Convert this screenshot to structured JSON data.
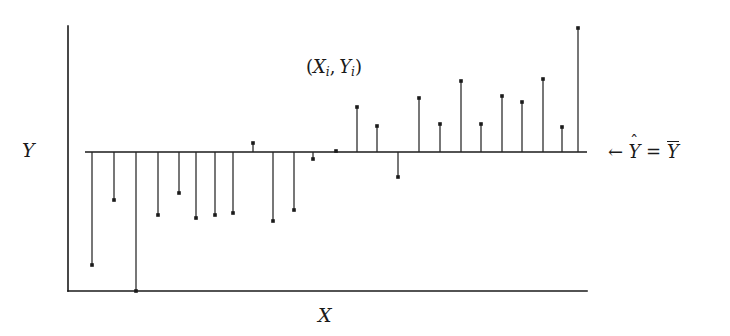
{
  "figure": {
    "title_alt": "Residual stem plot about the mean",
    "background_color": "#ffffff",
    "ink_color": "#1a1a1a"
  },
  "labels": {
    "y_axis": "Y",
    "x_axis": "X",
    "point_label_open": "(",
    "point_label_x": "X",
    "point_label_x_sub": "i",
    "point_label_comma": ",",
    "point_label_y": "Y",
    "point_label_y_sub": "i",
    "point_label_close": ")",
    "fit_arrow": "←",
    "fit_yhat": "Y",
    "fit_hat": "ˆ",
    "fit_equals": "=",
    "fit_ybar": "Y"
  },
  "chart_data": {
    "type": "scatter",
    "title": "",
    "xlabel": "X",
    "ylabel": "Y",
    "grid": false,
    "legend": null,
    "annotations": [
      {
        "text": "(X_i, Y_i)",
        "x_px": 306,
        "y_px": 58
      },
      {
        "text": "← Ŷ = Ȳ",
        "x_px": 608,
        "y_px": 141
      }
    ],
    "baseline": {
      "label": "Yhat = Ybar",
      "value": 0,
      "y_px": 152,
      "x_start_px": 85,
      "x_end_px": 587
    },
    "axes": {
      "y_axis_x_px": 68,
      "y_axis_top_px": 26,
      "y_axis_bottom_px": 291,
      "x_axis_y_px": 291,
      "x_axis_start_px": 68,
      "x_axis_end_px": 587
    },
    "note": "Residuals (Y_i - Ybar) plotted as vertical stems from the mean line; px values are screen coordinates, residual is (152 - y_px) so positive means above the mean line.",
    "points": [
      {
        "x_px": 92,
        "tip_y_px": 265,
        "residual_px": -113
      },
      {
        "x_px": 114,
        "tip_y_px": 200,
        "residual_px": -48
      },
      {
        "x_px": 136,
        "tip_y_px": 291,
        "residual_px": -139
      },
      {
        "x_px": 158,
        "tip_y_px": 215,
        "residual_px": -63
      },
      {
        "x_px": 179,
        "tip_y_px": 193,
        "residual_px": -41
      },
      {
        "x_px": 196,
        "tip_y_px": 218,
        "residual_px": -66
      },
      {
        "x_px": 215,
        "tip_y_px": 215,
        "residual_px": -63
      },
      {
        "x_px": 233,
        "tip_y_px": 213,
        "residual_px": -61
      },
      {
        "x_px": 253,
        "tip_y_px": 143,
        "residual_px": 9
      },
      {
        "x_px": 273,
        "tip_y_px": 221,
        "residual_px": -69
      },
      {
        "x_px": 294,
        "tip_y_px": 210,
        "residual_px": -58
      },
      {
        "x_px": 313,
        "tip_y_px": 159,
        "residual_px": -7
      },
      {
        "x_px": 336,
        "tip_y_px": 151,
        "residual_px": 1
      },
      {
        "x_px": 357,
        "tip_y_px": 107,
        "residual_px": 45
      },
      {
        "x_px": 377,
        "tip_y_px": 126,
        "residual_px": 26
      },
      {
        "x_px": 398,
        "tip_y_px": 177,
        "residual_px": -25
      },
      {
        "x_px": 419,
        "tip_y_px": 98,
        "residual_px": 54
      },
      {
        "x_px": 440,
        "tip_y_px": 124,
        "residual_px": 28
      },
      {
        "x_px": 461,
        "tip_y_px": 81,
        "residual_px": 71
      },
      {
        "x_px": 481,
        "tip_y_px": 124,
        "residual_px": 28
      },
      {
        "x_px": 502,
        "tip_y_px": 96,
        "residual_px": 56
      },
      {
        "x_px": 522,
        "tip_y_px": 102,
        "residual_px": 50
      },
      {
        "x_px": 543,
        "tip_y_px": 79,
        "residual_px": 73
      },
      {
        "x_px": 562,
        "tip_y_px": 127,
        "residual_px": 25
      },
      {
        "x_px": 578,
        "tip_y_px": 28,
        "residual_px": 124
      }
    ]
  }
}
